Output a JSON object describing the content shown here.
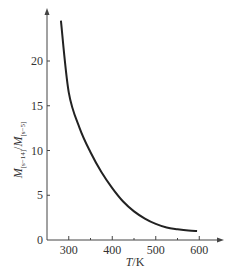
{
  "chart_data": {
    "type": "line",
    "title": "",
    "xlabel": "T/K",
    "ylabel": "M[s-14]/M[s-5]",
    "xlim": [
      250,
      640
    ],
    "ylim": [
      0,
      26
    ],
    "x_ticks": [
      300,
      400,
      500,
      600
    ],
    "y_ticks": [
      0,
      5,
      10,
      15,
      20
    ],
    "grid": false,
    "legend": null,
    "series": [
      {
        "name": "ratio",
        "x": [
          282,
          300,
          325,
          350,
          375,
          400,
          425,
          450,
          475,
          500,
          525,
          550,
          575,
          595
        ],
        "values": [
          24.5,
          16.5,
          12.5,
          9.8,
          7.6,
          5.8,
          4.3,
          3.2,
          2.4,
          1.8,
          1.4,
          1.2,
          1.05,
          1.0
        ]
      }
    ]
  },
  "labels": {
    "xlabel_T": "T",
    "xlabel_unit": "/K",
    "ylabel_main": "M",
    "ylabel_sub1": "[s−14]",
    "ylabel_slash": "/",
    "ylabel_sub2": "[s−5]"
  }
}
